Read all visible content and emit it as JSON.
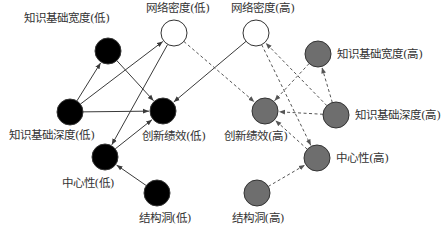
{
  "diagram": {
    "type": "directed-graph",
    "node_radius": 13,
    "colors": {
      "low_fill": "#000000",
      "high_fill": "#6e6e6e",
      "density_fill": "#ffffff",
      "stroke": "#333333",
      "solid_edge": "#3a3a3a",
      "dashed_edge": "#555555",
      "label": "#333333"
    },
    "nodes": [
      {
        "id": "kbw_low",
        "label": "知识基础宽度(低)",
        "x": 108,
        "y": 51,
        "fill": "low",
        "label_x": 67,
        "label_y": 22,
        "anchor": "middle"
      },
      {
        "id": "nd_low",
        "label": "网络密度(低)",
        "x": 174,
        "y": 33,
        "fill": "density",
        "label_x": 178,
        "label_y": 12,
        "anchor": "middle"
      },
      {
        "id": "nd_high",
        "label": "网络密度(高)",
        "x": 256,
        "y": 33,
        "fill": "density",
        "label_x": 263,
        "label_y": 12,
        "anchor": "middle"
      },
      {
        "id": "kbw_high",
        "label": "知识基础宽度(高)",
        "x": 318,
        "y": 54,
        "fill": "high",
        "label_x": 337,
        "label_y": 58,
        "anchor": "start"
      },
      {
        "id": "kbd_low",
        "label": "知识基础深度(低)",
        "x": 70,
        "y": 112,
        "fill": "low",
        "label_x": 52,
        "label_y": 139,
        "anchor": "middle"
      },
      {
        "id": "ip_low",
        "label": "创新绩效(低)",
        "x": 163,
        "y": 111,
        "fill": "low",
        "label_x": 174,
        "label_y": 140,
        "anchor": "middle"
      },
      {
        "id": "ip_high",
        "label": "创新绩效(高)",
        "x": 265,
        "y": 111,
        "fill": "high",
        "label_x": 256,
        "label_y": 140,
        "anchor": "middle"
      },
      {
        "id": "kbd_high",
        "label": "知识基础深度(高)",
        "x": 336,
        "y": 115,
        "fill": "high",
        "label_x": 355,
        "label_y": 119,
        "anchor": "start"
      },
      {
        "id": "cen_low",
        "label": "中心性(低)",
        "x": 105,
        "y": 157,
        "fill": "low",
        "label_x": 88,
        "label_y": 187,
        "anchor": "middle"
      },
      {
        "id": "cen_high",
        "label": "中心性(高)",
        "x": 317,
        "y": 158,
        "fill": "high",
        "label_x": 336,
        "label_y": 162,
        "anchor": "start"
      },
      {
        "id": "sh_low",
        "label": "结构洞(低)",
        "x": 157,
        "y": 193,
        "fill": "low",
        "label_x": 165,
        "label_y": 222,
        "anchor": "middle"
      },
      {
        "id": "sh_high",
        "label": "结构洞(高)",
        "x": 257,
        "y": 193,
        "fill": "high",
        "label_x": 258,
        "label_y": 222,
        "anchor": "middle"
      }
    ],
    "edges": [
      {
        "from": "kbd_low",
        "to": "kbw_low",
        "style": "solid"
      },
      {
        "from": "kbd_low",
        "to": "nd_low",
        "style": "solid"
      },
      {
        "from": "kbd_low",
        "to": "ip_low",
        "style": "solid"
      },
      {
        "from": "kbw_low",
        "to": "ip_low",
        "style": "solid"
      },
      {
        "from": "nd_low",
        "to": "cen_low",
        "style": "solid"
      },
      {
        "from": "cen_low",
        "to": "ip_low",
        "style": "solid"
      },
      {
        "from": "nd_high",
        "to": "ip_low",
        "style": "solid"
      },
      {
        "from": "sh_low",
        "to": "cen_low",
        "style": "solid"
      },
      {
        "from": "nd_low",
        "to": "ip_high",
        "style": "dashed"
      },
      {
        "from": "kbw_high",
        "to": "ip_high",
        "style": "dashed"
      },
      {
        "from": "kbd_high",
        "to": "ip_high",
        "style": "dashed"
      },
      {
        "from": "kbd_high",
        "to": "kbw_high",
        "style": "dashed"
      },
      {
        "from": "kbd_high",
        "to": "nd_high",
        "style": "dashed"
      },
      {
        "from": "nd_high",
        "to": "cen_high",
        "style": "dashed"
      },
      {
        "from": "cen_high",
        "to": "ip_high",
        "style": "dashed"
      },
      {
        "from": "sh_high",
        "to": "cen_high",
        "style": "dashed"
      }
    ]
  }
}
